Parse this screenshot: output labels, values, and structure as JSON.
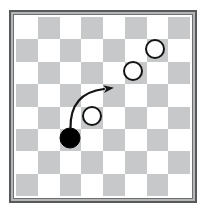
{
  "diagram": {
    "kind": "checkers-board-diagram",
    "board": {
      "rows": 8,
      "cols": 8,
      "dark_squares_parity": "odd"
    },
    "pieces": [
      {
        "type": "white",
        "row": 1,
        "col": 6,
        "dx": -2,
        "dy": -2
      },
      {
        "type": "white",
        "row": 2,
        "col": 5,
        "dx": -3,
        "dy": -2
      },
      {
        "type": "white",
        "row": 4,
        "col": 3,
        "dx": 0,
        "dy": -2
      },
      {
        "type": "black",
        "row": 5,
        "col": 2,
        "dx": 0,
        "dy": -2
      }
    ],
    "arrow": {
      "path": "M 54.5 111 Q 54 76 88 72",
      "from_cell": {
        "row": 5,
        "col": 2
      },
      "to_cell": {
        "row": 3,
        "col": 4
      }
    },
    "colors": {
      "board_light": "#ffffff",
      "board_dark": "#c7c8ca",
      "frame_dark": "#58595b",
      "frame_light": "#b5b6b8",
      "frame_mid": "#6f7072",
      "piece_outline": "#141414",
      "black_piece": "#000000",
      "arrow": "#141414"
    }
  }
}
